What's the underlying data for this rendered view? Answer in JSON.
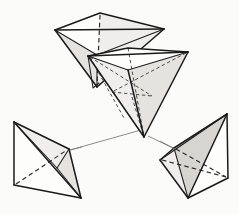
{
  "figure": {
    "kind": "geometric-line-drawing",
    "canvas": {
      "width": 239,
      "height": 214
    },
    "colors": {
      "background": "#fbfbfa",
      "edge_visible": "#1a1a1a",
      "edge_hidden": "#2a2a2a",
      "connector": "#777777",
      "face_light": "#efeeec",
      "face_mid": "#e4e3e0",
      "face_dark": "#d6d5d1"
    },
    "shapes": [
      {
        "id": "tetra-top",
        "label": "upper tetrahedron",
        "vertices": {
          "left": [
            55,
            30
          ],
          "top": [
            100,
            13
          ],
          "right": [
            164,
            29
          ],
          "apex": [
            97,
            87
          ]
        },
        "faces": [
          {
            "name": "top-left-face",
            "points": "55,30 100,13 97,55",
            "shade": "face-white"
          },
          {
            "name": "top-right-face",
            "points": "100,13 164,29 97,55",
            "shade": "face-light"
          },
          {
            "name": "front-left-face",
            "points": "55,30 97,55 97,87",
            "shade": "face-mid"
          },
          {
            "name": "front-right-face",
            "points": "97,55 164,29 97,87",
            "shade": "face-light"
          }
        ],
        "solid_edges": [
          "55,30 100,13",
          "100,13 164,29",
          "55,30 164,29",
          "55,30 97,87",
          "164,29 97,87",
          "55,30 97,55",
          "97,55 164,29"
        ],
        "hidden_edges": [
          "100,13 97,87"
        ]
      },
      {
        "id": "tetra-middle",
        "label": "middle-right tetrahedron",
        "vertices": {
          "left": [
            88,
            56
          ],
          "back": [
            128,
            48
          ],
          "right": [
            188,
            52
          ],
          "apex": [
            144,
            137
          ]
        },
        "faces": [
          {
            "name": "top-face",
            "points": "88,56 128,48 188,52",
            "shade": "face-white"
          },
          {
            "name": "left-face",
            "points": "88,56 128,70 144,137",
            "shade": "face-light"
          },
          {
            "name": "right-face",
            "points": "128,70 188,52 144,137",
            "shade": "face-mid"
          }
        ],
        "solid_edges": [
          "88,56 128,48",
          "128,48 188,52",
          "88,56 188,52",
          "88,56 128,70",
          "128,70 188,52",
          "128,70 144,137",
          "88,56 144,137",
          "188,52 144,137"
        ],
        "hidden_edges": [
          "128,48 144,137",
          "88,56 152,96",
          "188,52 112,92",
          "95,64 144,137"
        ]
      },
      {
        "id": "tetra-lower-left",
        "label": "lower-left tetrahedron",
        "vertices": {
          "top": [
            14,
            122
          ],
          "bottom-left": [
            14,
            185
          ],
          "right": [
            69,
            149
          ],
          "bottom": [
            81,
            198
          ]
        },
        "faces": [
          {
            "name": "upper-face",
            "points": "14,122 69,149 57,168",
            "shade": "face-light"
          },
          {
            "name": "side-face",
            "points": "14,122 57,168 14,185",
            "shade": "face-white"
          },
          {
            "name": "front-face",
            "points": "57,168 69,149 81,198",
            "shade": "face-mid"
          },
          {
            "name": "lower-face",
            "points": "14,185 57,168 81,198",
            "shade": "face-white"
          }
        ],
        "solid_edges": [
          "14,122 14,185",
          "14,122 69,149",
          "14,122 81,198",
          "69,149 81,198",
          "14,185 81,198",
          "14,122 57,168",
          "57,168 69,149"
        ],
        "hidden_edges": [
          "14,185 69,149"
        ]
      },
      {
        "id": "tetra-lower-right",
        "label": "lower-right tetrahedron",
        "vertices": {
          "apex": [
            227,
            114
          ],
          "left": [
            160,
            160
          ],
          "upper-left": [
            174,
            148
          ],
          "bottom": [
            188,
            198
          ],
          "right": [
            228,
            178
          ]
        },
        "faces": [
          {
            "name": "upper-face",
            "points": "227,114 174,148 188,198",
            "shade": "face-dark"
          },
          {
            "name": "left-face",
            "points": "174,148 160,160 188,198",
            "shade": "face-light"
          },
          {
            "name": "right-face",
            "points": "227,114 188,198 228,178",
            "shade": "face-white"
          }
        ],
        "solid_edges": [
          "227,114 174,148",
          "174,148 160,160",
          "160,160 188,198",
          "188,198 228,178",
          "228,178 227,114",
          "227,114 188,198",
          "174,148 188,198",
          "227,114 160,160"
        ],
        "hidden_edges": [
          "174,148 228,178",
          "160,160 228,178"
        ]
      }
    ],
    "connectors": [
      {
        "name": "middle-to-lower-left",
        "from": [
          141,
          130
        ],
        "to": [
          70,
          150
        ]
      },
      {
        "name": "middle-to-lower-right",
        "from": [
          148,
          136
        ],
        "to": [
          175,
          149
        ]
      }
    ]
  }
}
